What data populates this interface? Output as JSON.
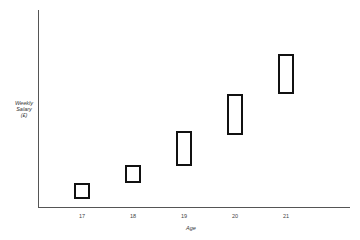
{
  "chart_data": {
    "type": "box-range",
    "title": "",
    "xlabel": "Age",
    "ylabel": "Weekly Salary (£)",
    "ylabel_lines": [
      "Weekly",
      "Salary",
      "(£)"
    ],
    "categories": [
      "17",
      "18",
      "19",
      "20",
      "21"
    ],
    "ranges": [
      {
        "age": "17",
        "low": 8,
        "high": 24
      },
      {
        "age": "18",
        "low": 24,
        "high": 42
      },
      {
        "age": "19",
        "low": 42,
        "high": 76
      },
      {
        "age": "20",
        "low": 73,
        "high": 113
      },
      {
        "age": "21",
        "low": 114,
        "high": 153
      }
    ],
    "y_tick_labels": false,
    "grid": false,
    "legend": null,
    "note": "Y-axis has no numeric scale; values are relative pixel heights above x-axis"
  },
  "layout": {
    "boxes": [
      {
        "left": 74,
        "top": 183,
        "width": 16,
        "height": 16
      },
      {
        "left": 125,
        "top": 165,
        "width": 16,
        "height": 18
      },
      {
        "left": 176,
        "top": 131,
        "width": 16,
        "height": 35
      },
      {
        "left": 227,
        "top": 94,
        "width": 16,
        "height": 41
      },
      {
        "left": 278,
        "top": 54,
        "width": 16,
        "height": 40
      }
    ],
    "tick_x": [
      72,
      123,
      174,
      225,
      276
    ]
  }
}
